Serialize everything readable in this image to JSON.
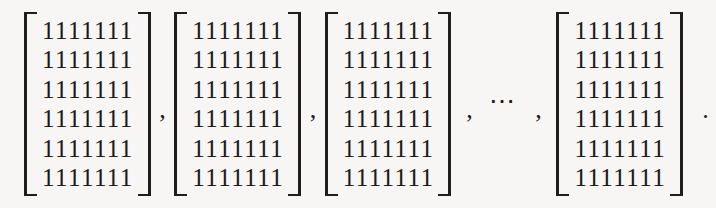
{
  "expression": {
    "description": "List of four identical all-ones matrices separated by commas with a centered ellipsis before the last, ending in a period",
    "matrix_row_text": "1111111",
    "rows_per_matrix": 6,
    "columns_per_matrix": 7,
    "matrices": [
      {
        "label": "matrix-1",
        "rows": [
          "1111111",
          "1111111",
          "1111111",
          "1111111",
          "1111111",
          "1111111"
        ]
      },
      {
        "label": "matrix-2",
        "rows": [
          "1111111",
          "1111111",
          "1111111",
          "1111111",
          "1111111",
          "1111111"
        ]
      },
      {
        "label": "matrix-3",
        "rows": [
          "1111111",
          "1111111",
          "1111111",
          "1111111",
          "1111111",
          "1111111"
        ]
      },
      {
        "label": "matrix-4",
        "rows": [
          "1111111",
          "1111111",
          "1111111",
          "1111111",
          "1111111",
          "1111111"
        ]
      }
    ],
    "separators": {
      "comma": ",",
      "ellipsis": "⋯",
      "period": "."
    },
    "colors": {
      "ink": "#1c1a18",
      "bracket": "#201e1c",
      "background": "#f7f6f4"
    }
  }
}
